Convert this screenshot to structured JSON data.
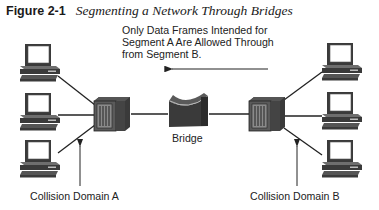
{
  "figure": {
    "number": "Figure 2-1",
    "title": "Segmenting a Network Through Bridges"
  },
  "annotation": {
    "lines": [
      "Only Data Frames Intended for",
      "Segment A Are Allowed Through",
      "from Segment B."
    ],
    "arrow_direction": "left"
  },
  "devices": {
    "bridge": {
      "label": "Bridge",
      "icon": "bridge-icon"
    },
    "hub_a": {
      "icon": "hub-icon"
    },
    "hub_b": {
      "icon": "hub-icon"
    },
    "segment_a_hosts": 3,
    "segment_b_hosts": 3
  },
  "labels": {
    "collision_domain_a": "Collision Domain A",
    "collision_domain_b": "Collision Domain B"
  },
  "colors": {
    "device_dark": "#3a3a3a",
    "device_mid": "#6e6e6e",
    "device_light": "#bdbdbd",
    "line": "#222222"
  }
}
